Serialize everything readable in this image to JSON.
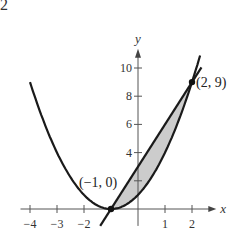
{
  "corner_label": "2",
  "chart_data": {
    "type": "line",
    "title": "",
    "xlabel": "x",
    "ylabel": "y",
    "xlim": [
      -4.5,
      2.9
    ],
    "ylim": [
      -1.2,
      11.5
    ],
    "x_ticks": [
      -4,
      -3,
      -2,
      1,
      2
    ],
    "x_tick_labels": [
      "−4",
      "−3",
      "−2",
      "1",
      "2"
    ],
    "y_ticks": [
      2,
      4,
      6,
      8,
      10
    ],
    "y_tick_labels": [
      "",
      "4",
      "6",
      "8",
      "10"
    ],
    "grid": false,
    "series": [
      {
        "name": "parabola y=(x+1)^2",
        "type": "curve",
        "x": [
          -4,
          -3,
          -2,
          -1,
          0,
          1,
          2,
          2.3
        ],
        "y": [
          9,
          4,
          1,
          0,
          1,
          4,
          9,
          10.9
        ]
      },
      {
        "name": "line y=3x+3",
        "type": "line",
        "x": [
          -1.4,
          2.35
        ],
        "y": [
          -1.2,
          10.05
        ]
      }
    ],
    "shaded_region": {
      "between": [
        "line y=3x+3",
        "parabola y=(x+1)^2"
      ],
      "x_range": [
        -1,
        2
      ],
      "fill": "#cccccc"
    },
    "points": [
      {
        "label": "(−1, 0)",
        "x": -1,
        "y": 0
      },
      {
        "label": "(2, 9)",
        "x": 2,
        "y": 9
      }
    ]
  }
}
